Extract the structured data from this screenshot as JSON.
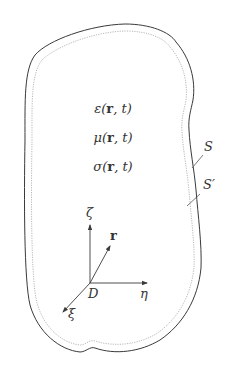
{
  "diagram": {
    "type": "electromagnetic-domain-schematic",
    "boundaries": [
      {
        "id": "outer",
        "label": "S",
        "style": "solid",
        "color": "#3a3a3a"
      },
      {
        "id": "inner",
        "label": "S′",
        "style": "dotted",
        "color": "#b0b0b0"
      }
    ],
    "material_params": [
      {
        "symbol": "ε",
        "args": "(r, t)",
        "prefix": "ε(",
        "bold": "r",
        "suffix": ", t)"
      },
      {
        "symbol": "μ",
        "args": "(r, t)",
        "prefix": "μ(",
        "bold": "r",
        "suffix": ", t)"
      },
      {
        "symbol": "σ",
        "args": "(r, t)",
        "prefix": "σ(",
        "bold": "r",
        "suffix": ", t)"
      }
    ],
    "labels": {
      "outer_surface": "S",
      "inner_surface": "S′",
      "origin": "D",
      "position_vector": "r",
      "axis_zeta": "ζ",
      "axis_eta": "η",
      "axis_xi": "ξ"
    },
    "colors": {
      "line": "#3a3a3a",
      "dotted": "#b0b0b0",
      "text": "#333333",
      "background": "#ffffff"
    }
  }
}
